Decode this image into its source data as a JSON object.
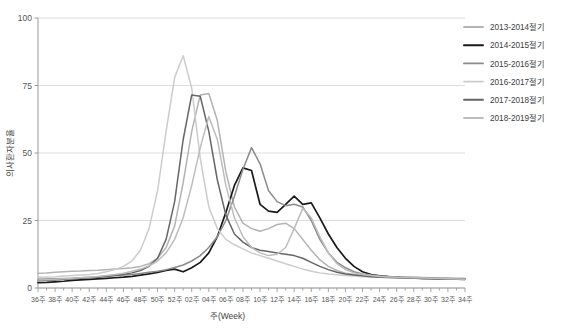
{
  "chart_data": {
    "type": "line",
    "title": "",
    "xlabel": "주(Week)",
    "ylabel": "의사환자분율",
    "ylim": [
      0,
      100
    ],
    "yticks": [
      0,
      25,
      50,
      75,
      100
    ],
    "grid": true,
    "legend_position": "top-right",
    "x": [
      "36주",
      "37주",
      "38주",
      "39주",
      "40주",
      "41주",
      "42주",
      "43주",
      "44주",
      "45주",
      "46주",
      "47주",
      "48주",
      "49주",
      "50주",
      "51주",
      "52주",
      "01주",
      "02주",
      "03주",
      "04주",
      "05주",
      "06주",
      "07주",
      "08주",
      "09주",
      "10주",
      "11주",
      "12주",
      "13주",
      "14주",
      "15주",
      "16주",
      "17주",
      "18주",
      "19주",
      "20주",
      "21주",
      "22주",
      "23주",
      "24주",
      "25주",
      "26주",
      "27주",
      "28주",
      "29주",
      "30주",
      "31주",
      "32주",
      "33주",
      "34주"
    ],
    "xticks": [
      "36주",
      "38주",
      "40주",
      "42주",
      "44주",
      "46주",
      "48주",
      "50주",
      "52주",
      "02주",
      "04주",
      "06주",
      "08주",
      "10주",
      "12주",
      "14주",
      "16주",
      "18주",
      "20주",
      "22주",
      "24주",
      "26주",
      "28주",
      "30주",
      "32주",
      "34주"
    ],
    "series": [
      {
        "name": "2013-2014절기",
        "color": "#b3b3b3",
        "width": 1.5,
        "values": [
          5.5,
          5.6,
          5.8,
          6.0,
          6.2,
          6.3,
          6.5,
          6.6,
          6.8,
          7.0,
          7.2,
          7.5,
          8.0,
          9.0,
          11.0,
          15.0,
          23.0,
          39.0,
          58.0,
          71.5,
          72.0,
          62.0,
          43.0,
          30.0,
          24.0,
          22.0,
          21.0,
          22.0,
          23.5,
          24.0,
          22.0,
          18.0,
          14.0,
          10.5,
          8.0,
          6.5,
          5.5,
          5.0,
          4.6,
          4.4,
          4.3,
          4.2,
          4.1,
          4.0,
          4.0,
          3.9,
          3.8,
          3.8,
          3.7,
          3.6,
          3.6
        ]
      },
      {
        "name": "2014-2015절기",
        "color": "#1a1a1a",
        "width": 1.7,
        "values": [
          2.0,
          2.1,
          2.3,
          2.5,
          2.8,
          3.0,
          3.2,
          3.4,
          3.6,
          3.8,
          4.0,
          4.3,
          4.8,
          5.2,
          5.8,
          6.5,
          7.0,
          6.0,
          7.5,
          9.5,
          13.0,
          19.0,
          28.0,
          38.0,
          44.5,
          43.5,
          31.0,
          28.5,
          28.0,
          31.0,
          34.0,
          31.0,
          31.5,
          26.0,
          20.0,
          15.0,
          11.0,
          8.0,
          6.0,
          5.0,
          4.5,
          4.2,
          4.0,
          3.8,
          3.7,
          3.6,
          3.5,
          3.4,
          3.4,
          3.3,
          3.2
        ]
      },
      {
        "name": "2015-2016절기",
        "color": "#8c8c8c",
        "width": 1.5,
        "values": [
          3.2,
          3.3,
          3.4,
          3.5,
          3.6,
          3.8,
          4.0,
          4.2,
          4.4,
          4.6,
          4.8,
          5.0,
          5.4,
          5.8,
          6.2,
          6.8,
          7.6,
          8.5,
          10.0,
          12.0,
          15.0,
          19.0,
          25.0,
          34.0,
          44.0,
          52.0,
          46.0,
          36.0,
          32.0,
          30.5,
          31.0,
          30.0,
          25.0,
          18.0,
          13.0,
          9.5,
          7.5,
          6.0,
          5.2,
          4.8,
          4.5,
          4.3,
          4.1,
          4.0,
          3.9,
          3.8,
          3.7,
          3.6,
          3.5,
          3.4,
          3.3
        ]
      },
      {
        "name": "2016-2017절기",
        "color": "#cccccc",
        "width": 1.5,
        "values": [
          4.0,
          4.1,
          4.2,
          4.4,
          4.6,
          4.8,
          5.0,
          5.4,
          6.0,
          6.8,
          8.0,
          10.0,
          14.0,
          22.0,
          36.0,
          58.0,
          78.0,
          86.0,
          74.0,
          48.0,
          30.0,
          22.0,
          18.0,
          16.0,
          14.5,
          13.0,
          12.0,
          11.0,
          10.0,
          9.0,
          8.0,
          7.0,
          6.2,
          5.6,
          5.2,
          4.9,
          4.6,
          4.4,
          4.2,
          4.1,
          4.0,
          3.9,
          3.8,
          3.7,
          3.6,
          3.6,
          3.5,
          3.5,
          3.4,
          3.4,
          3.3
        ]
      },
      {
        "name": "2017-2018절기",
        "color": "#666666",
        "width": 1.5,
        "values": [
          2.8,
          2.9,
          3.0,
          3.2,
          3.4,
          3.6,
          3.8,
          4.0,
          4.3,
          4.6,
          5.0,
          5.6,
          6.5,
          8.0,
          11.0,
          18.0,
          32.0,
          55.0,
          71.5,
          71.0,
          58.0,
          40.0,
          27.0,
          20.0,
          17.0,
          15.0,
          14.0,
          13.5,
          13.0,
          12.5,
          12.0,
          11.0,
          9.5,
          8.0,
          6.8,
          5.8,
          5.2,
          4.8,
          4.5,
          4.2,
          4.0,
          3.9,
          3.8,
          3.7,
          3.6,
          3.5,
          3.5,
          3.4,
          3.3,
          3.3,
          3.2
        ]
      },
      {
        "name": "2018-2019절기",
        "color": "#bdbdbd",
        "width": 1.5,
        "values": [
          3.0,
          3.1,
          3.2,
          3.4,
          3.6,
          3.8,
          4.0,
          4.3,
          4.6,
          5.0,
          5.5,
          6.2,
          7.0,
          8.2,
          10.0,
          13.0,
          18.0,
          26.0,
          38.0,
          52.0,
          63.5,
          55.0,
          38.0,
          26.0,
          19.0,
          15.0,
          13.0,
          12.0,
          12.5,
          15.0,
          22.0,
          29.5,
          26.0,
          19.0,
          13.0,
          9.0,
          6.8,
          5.6,
          5.0,
          4.6,
          4.3,
          4.1,
          4.0,
          3.9,
          3.8,
          3.7,
          3.6,
          3.5,
          3.4,
          3.3,
          3.2
        ]
      }
    ]
  },
  "legend": {
    "items": [
      {
        "label": "2013-2014절기"
      },
      {
        "label": "2014-2015절기"
      },
      {
        "label": "2015-2016절기"
      },
      {
        "label": "2016-2017절기"
      },
      {
        "label": "2017-2018절기"
      },
      {
        "label": "2018-2019절기"
      }
    ]
  },
  "axes": {
    "y_label": "의사환자분율",
    "x_label": "주(Week)",
    "y_ticks": [
      "0",
      "25",
      "50",
      "75",
      "100"
    ]
  },
  "colors": {
    "grid": "#d9d9d9",
    "axis": "#9a9a9a",
    "text": "#555555",
    "background": "#ffffff"
  }
}
